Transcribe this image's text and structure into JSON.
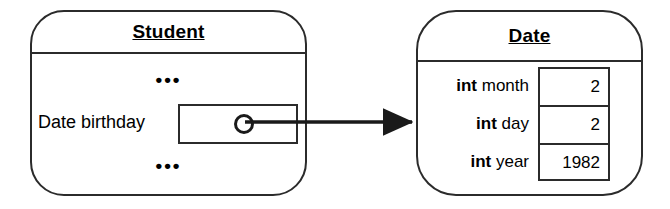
{
  "diagram": {
    "type": "object-reference-diagram",
    "colors": {
      "stroke": "#2b2b2b",
      "background": "#ffffff",
      "text": "#000000"
    },
    "objects": [
      {
        "id": "student",
        "title": "Student",
        "ellipsis_top": "•••",
        "ellipsis_bottom": "•••",
        "field": {
          "label": "Date birthday",
          "value_kind": "reference-pointer"
        }
      },
      {
        "id": "date",
        "title": "Date",
        "fields": [
          {
            "type": "int",
            "name": " month",
            "value": "2"
          },
          {
            "type": "int",
            "name": " day",
            "value": "2"
          },
          {
            "type": "int",
            "name": " year",
            "value": "1982"
          }
        ]
      }
    ],
    "connector": {
      "name": "reference-arrow",
      "from": "student.birthday.pointer",
      "to": "date",
      "style": "solid-line-filled-arrowhead"
    }
  }
}
